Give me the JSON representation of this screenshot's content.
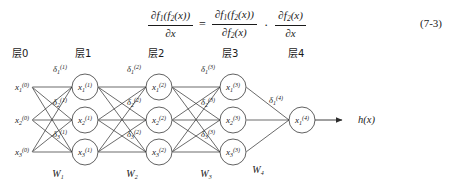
{
  "figure": {
    "equation": {
      "number": "(7-3)",
      "lhs": {
        "numerator": "∂f1(f2(x))",
        "denominator": "∂x"
      },
      "equals": "=",
      "rhs_term1": {
        "numerator": "∂f1(f2(x))",
        "denominator": "∂f2(x)"
      },
      "multiply": "·",
      "rhs_term2": {
        "numerator": "∂f2(x)",
        "denominator": "∂x"
      },
      "parts": {
        "partial": "∂",
        "f": "f",
        "one": "1",
        "two": "2",
        "x": "x",
        "open_outer": "(",
        "close_outer": ")",
        "open_inner": "(",
        "close_inner": ")"
      }
    },
    "layer_headers": [
      {
        "text": "层0",
        "x": 12
      },
      {
        "text": "层1",
        "x": 75
      },
      {
        "text": "层2",
        "x": 148
      },
      {
        "text": "层3",
        "x": 222
      },
      {
        "text": "层4",
        "x": 288
      }
    ],
    "weight_labels": [
      {
        "text": "W",
        "subscript": "1",
        "x": 58,
        "y": 132
      },
      {
        "text": "W",
        "subscript": "2",
        "x": 132,
        "y": 132
      },
      {
        "text": "W",
        "subscript": "3",
        "x": 206,
        "y": 132
      },
      {
        "text": "W",
        "subscript": "4",
        "x": 258,
        "y": 128
      }
    ],
    "layers": [
      {
        "index": 0,
        "cx": 22,
        "circled": false,
        "nodes": [
          {
            "sym": "x",
            "sub": "1",
            "sup": "(0)",
            "cy": 42
          },
          {
            "sym": "x",
            "sub": "2",
            "sup": "(0)",
            "cy": 75
          },
          {
            "sym": "x",
            "sub": "3",
            "sup": "(0)",
            "cy": 107
          }
        ]
      },
      {
        "index": 1,
        "cx": 85,
        "circled": true,
        "deltas": [
          {
            "sym": "δ",
            "sub": "1",
            "sup": "(1)",
            "x": 60,
            "y": 27
          },
          {
            "sym": "δ",
            "sub": "2",
            "sup": "(1)",
            "x": 60,
            "y": 60
          },
          {
            "sym": "δ",
            "sub": "3",
            "sup": "(1)",
            "x": 60,
            "y": 92
          }
        ],
        "nodes": [
          {
            "sym": "x",
            "sub": "1",
            "sup": "(1)",
            "cy": 42
          },
          {
            "sym": "x",
            "sub": "2",
            "sup": "(1)",
            "cy": 75
          },
          {
            "sym": "x",
            "sub": "3",
            "sup": "(1)",
            "cy": 107
          }
        ]
      },
      {
        "index": 2,
        "cx": 159,
        "circled": true,
        "deltas": [
          {
            "sym": "δ",
            "sub": "1",
            "sup": "(2)",
            "x": 134,
            "y": 27
          },
          {
            "sym": "δ",
            "sub": "2",
            "sup": "(2)",
            "x": 134,
            "y": 60
          },
          {
            "sym": "δ",
            "sub": "3",
            "sup": "(2)",
            "x": 134,
            "y": 92
          }
        ],
        "nodes": [
          {
            "sym": "x",
            "sub": "1",
            "sup": "(2)",
            "cy": 42
          },
          {
            "sym": "x",
            "sub": "2",
            "sup": "(2)",
            "cy": 75
          },
          {
            "sym": "x",
            "sub": "3",
            "sup": "(2)",
            "cy": 107
          }
        ]
      },
      {
        "index": 3,
        "cx": 233,
        "circled": true,
        "deltas": [
          {
            "sym": "δ",
            "sub": "1",
            "sup": "(3)",
            "x": 208,
            "y": 27
          },
          {
            "sym": "δ",
            "sub": "2",
            "sup": "(3)",
            "x": 208,
            "y": 60
          },
          {
            "sym": "δ",
            "sub": "3",
            "sup": "(3)",
            "x": 208,
            "y": 92
          }
        ],
        "nodes": [
          {
            "sym": "x",
            "sub": "1",
            "sup": "(3)",
            "cy": 42
          },
          {
            "sym": "x",
            "sub": "2",
            "sup": "(3)",
            "cy": 75
          },
          {
            "sym": "x",
            "sub": "3",
            "sup": "(3)",
            "cy": 107
          }
        ]
      },
      {
        "index": 4,
        "cx": 302,
        "circled": true,
        "deltas": [
          {
            "sym": "δ",
            "sub": "1",
            "sup": "(4)",
            "x": 276,
            "y": 58
          }
        ],
        "nodes": [
          {
            "sym": "x",
            "sub": "1",
            "sup": "(4)",
            "cy": 75
          }
        ]
      }
    ],
    "output": {
      "label": "h(x)",
      "x": 358,
      "y": 78
    },
    "colors": {
      "background": "#ffffff",
      "ink": "#1a1a1a",
      "edge": "#2b2b2b",
      "node_stroke": "#3a3a3a"
    }
  }
}
